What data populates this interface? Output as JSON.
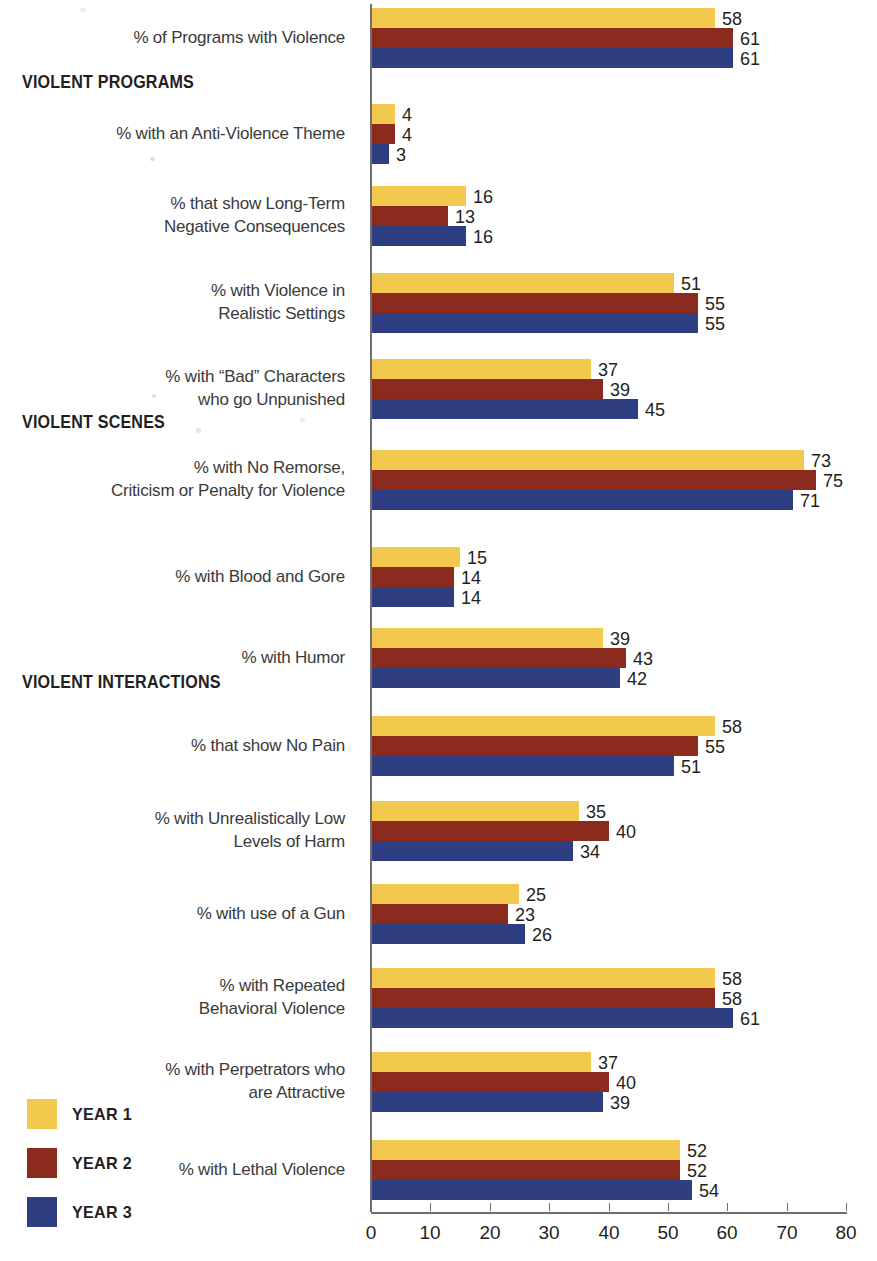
{
  "legend": {
    "position": "bottom-left",
    "items": [
      {
        "label": "YEAR 1",
        "color": "#f2c94c"
      },
      {
        "label": "YEAR 2",
        "color": "#8b2b1e"
      },
      {
        "label": "YEAR 3",
        "color": "#2e3e80"
      }
    ]
  },
  "axis": {
    "ticks": [
      "0",
      "10",
      "20",
      "30",
      "40",
      "50",
      "60",
      "70",
      "80"
    ]
  },
  "sections": [
    {
      "label": "VIOLENT PROGRAMS"
    },
    {
      "label": "VIOLENT SCENES"
    },
    {
      "label": "VIOLENT INTERACTIONS"
    }
  ],
  "chart_data": {
    "type": "bar",
    "orientation": "horizontal",
    "title": "",
    "xlabel": "",
    "ylabel": "",
    "xlim": [
      0,
      80
    ],
    "grid": false,
    "legend_position": "bottom-left",
    "series": [
      {
        "name": "YEAR 1",
        "color": "#f2c94c",
        "values": [
          58,
          4,
          16,
          51,
          37,
          73,
          15,
          39,
          58,
          35,
          25,
          58,
          37,
          52
        ]
      },
      {
        "name": "YEAR 2",
        "color": "#8b2b1e",
        "values": [
          61,
          4,
          13,
          55,
          39,
          75,
          14,
          43,
          55,
          40,
          23,
          58,
          40,
          52
        ]
      },
      {
        "name": "YEAR 3",
        "color": "#2e3e80",
        "values": [
          61,
          3,
          16,
          55,
          45,
          71,
          14,
          42,
          51,
          34,
          26,
          61,
          39,
          54
        ]
      }
    ],
    "categories": [
      "% of Programs with Violence",
      "% with an Anti-Violence Theme",
      "% that show Long-Term\nNegative Consequences",
      "% with Violence in\nRealistic Settings",
      "% with “Bad” Characters\nwho go Unpunished",
      "% with No Remorse,\nCriticism or Penalty for Violence",
      "% with Blood and Gore",
      "% with Humor",
      "% that show No Pain",
      "% with Unrealistically Low\nLevels of Harm",
      "% with use of a Gun",
      "% with Repeated\nBehavioral Violence",
      "% with Perpetrators who\nare Attractive",
      "% with Lethal Violence"
    ],
    "section_headers": [
      {
        "label": "VIOLENT PROGRAMS",
        "before_category_index": 1
      },
      {
        "label": "VIOLENT SCENES",
        "before_category_index": 5
      },
      {
        "label": "VIOLENT INTERACTIONS",
        "before_category_index": 8
      }
    ]
  }
}
